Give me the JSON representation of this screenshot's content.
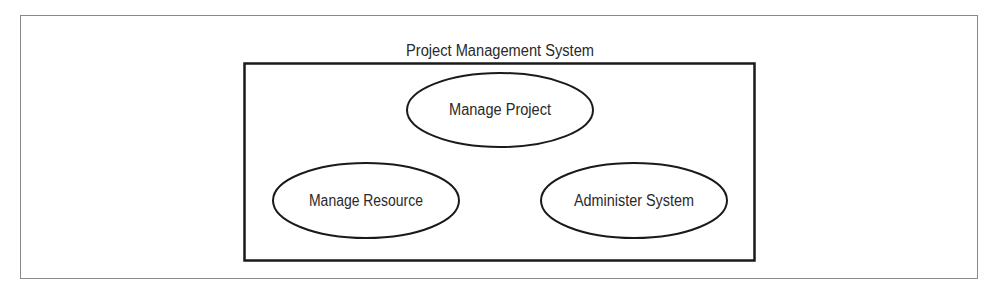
{
  "diagram": {
    "type": "uml-use-case",
    "system_boundary": {
      "title": "Project Management System"
    },
    "use_cases": [
      {
        "id": "manage-project",
        "label": "Manage Project"
      },
      {
        "id": "manage-resource",
        "label": "Manage Resource"
      },
      {
        "id": "administer-system",
        "label": "Administer System"
      }
    ],
    "colors": {
      "stroke": "#1a1a1a",
      "frame": "#8a8a8a",
      "text": "#2a2a2a",
      "background": "#ffffff"
    }
  }
}
